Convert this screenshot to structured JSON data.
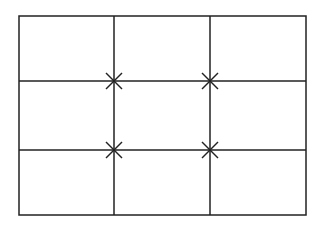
{
  "diagram": {
    "type": "rule-of-thirds-grid",
    "background": "#ffffff",
    "stroke_color": "#222222",
    "frame": {
      "x": 19,
      "y": 16,
      "width": 287,
      "height": 199
    },
    "columns": 3,
    "rows": 3,
    "vertical_lines_x": [
      114,
      210
    ],
    "horizontal_lines_y": [
      81,
      150
    ],
    "intersection_markers": [
      {
        "x": 114,
        "y": 81,
        "symbol": "asterisk-x"
      },
      {
        "x": 210,
        "y": 81,
        "symbol": "asterisk-x"
      },
      {
        "x": 114,
        "y": 150,
        "symbol": "asterisk-x"
      },
      {
        "x": 210,
        "y": 150,
        "symbol": "asterisk-x"
      }
    ]
  }
}
